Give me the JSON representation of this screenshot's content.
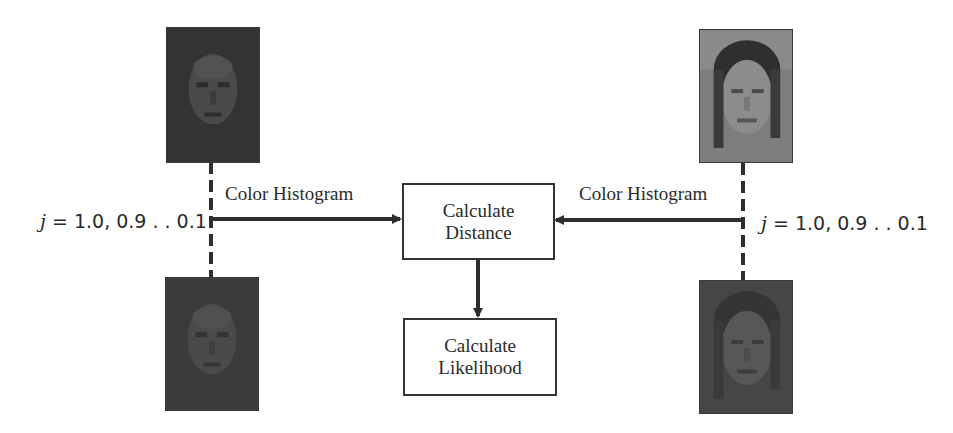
{
  "diagram": {
    "left_branch": {
      "top_image": {
        "alt": "Original face image (dark)",
        "tone": "#3a3a3a"
      },
      "bottom_image": {
        "alt": "Degraded face image (dark)",
        "tone": "#3d3d3d"
      },
      "arrow_label": "Color Histogram",
      "param_var": "j",
      "param_values": "= 1.0, 0.9 . . 0.1"
    },
    "right_branch": {
      "top_image": {
        "alt": "Original face image (bright)",
        "tone": "#7a7a7a"
      },
      "bottom_image": {
        "alt": "Degraded face image (dark)",
        "tone": "#474747"
      },
      "arrow_label": "Color Histogram",
      "param_var": "j",
      "param_values": "= 1.0, 0.9 . . 0.1"
    },
    "process_boxes": [
      {
        "line1": "Calculate",
        "line2": "Distance"
      },
      {
        "line1": "Calculate",
        "line2": "Likelihood"
      }
    ],
    "colors": {
      "line": "#2e2e2e",
      "text": "#2a2a2a",
      "background": "#ffffff"
    }
  }
}
